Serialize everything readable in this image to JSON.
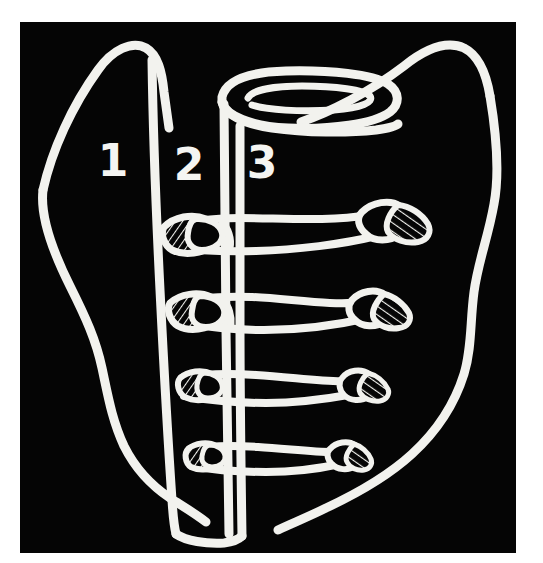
{
  "figure": {
    "background_color": "#ffffff",
    "plate_color": "#050505",
    "ink_color": "#f2f2ee",
    "plate": {
      "x": 20,
      "y": 22,
      "width": 496,
      "height": 531
    },
    "stroke_width": 9
  },
  "labels": {
    "zone_1": {
      "text": "1",
      "x": 113,
      "y": 176
    },
    "zone_2": {
      "text": "2",
      "x": 185,
      "y": 180
    },
    "zone_3": {
      "text": "3",
      "x": 257,
      "y": 178
    }
  },
  "structures": {
    "outline_name": "body-outline",
    "trachea_name": "trachea-opening",
    "column_left_name": "zone-divider-1-2",
    "column_right_name": "zone-divider-2-3",
    "rib_count": 4,
    "ribs": [
      {
        "name": "rib-1",
        "left_y": 232,
        "right_y": 215,
        "tip_x": 414
      },
      {
        "name": "rib-2",
        "left_y": 309,
        "right_y": 303,
        "tip_x": 398
      },
      {
        "name": "rib-3",
        "left_y": 383,
        "right_y": 381,
        "tip_x": 378
      },
      {
        "name": "rib-4",
        "left_y": 452,
        "right_y": 452,
        "tip_x": 362
      }
    ]
  }
}
